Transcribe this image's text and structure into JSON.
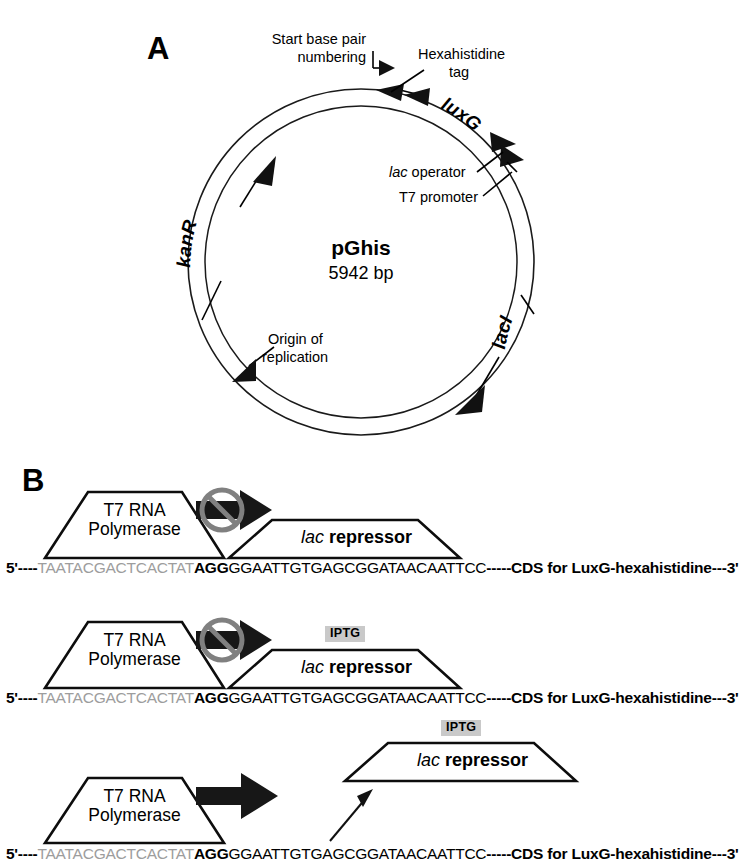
{
  "figure": {
    "panel_a_letter": "A",
    "panel_b_letter": "B"
  },
  "panel_a": {
    "plasmid_name": "pGhis",
    "plasmid_size": "5942 bp",
    "annotations": {
      "start_numbering_line1": "Start base pair",
      "start_numbering_line2": "numbering",
      "hexahistidine_line1": "Hexahistidine",
      "hexahistidine_line2": "tag",
      "lac_operator_italic": "lac",
      "lac_operator_rest": " operator",
      "t7_promoter": "T7 promoter",
      "origin_line1": "Origin of",
      "origin_line2": "replication",
      "kanR": "kanR",
      "luxG": "luxG",
      "lacI": "lacI"
    }
  },
  "panel_b": {
    "polymerase_line1": "T7 RNA",
    "polymerase_line2": "Polymerase",
    "repressor_italic": "lac",
    "repressor_rest": "repressor",
    "iptg_label": "IPTG",
    "sequence": {
      "five_prime": "5'----",
      "promoter_gray": "TAATACGACTCACTAT",
      "start_bold": "AGG",
      "operator": "GGAATTGTGAGCGGATAACAATTCC",
      "cds": "-----CDS for LuxG-hexahistidine---3'"
    },
    "rows": [
      {
        "id": "row-repressed-no-iptg",
        "transcription_blocked": true,
        "iptg_present": false,
        "repressor_bound": true
      },
      {
        "id": "row-repressed-with-iptg",
        "transcription_blocked": true,
        "iptg_present": true,
        "repressor_bound": true
      },
      {
        "id": "row-transcribing-iptg-released",
        "transcription_blocked": false,
        "iptg_present": true,
        "repressor_bound": false
      }
    ]
  },
  "colors": {
    "ink": "#000000",
    "gray_sequence": "#9d9d9d",
    "ban_gray": "#808080",
    "iptg_badge_bg": "#c9c9c9",
    "arrow_fill": "#171717",
    "background": "#ffffff"
  }
}
